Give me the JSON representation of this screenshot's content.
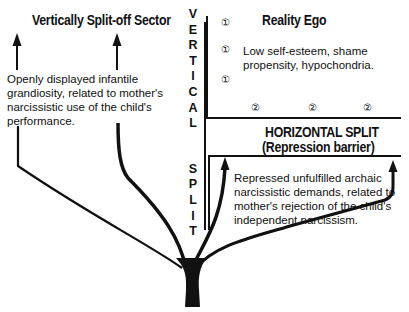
{
  "labels": {
    "vertically_split_off_sector": "Vertically Split-off Sector",
    "reality_ego": "Reality Ego",
    "horizontal_split_line1": "HORIZONTAL SPLIT",
    "horizontal_split_line2": "(Repression barrier)",
    "vertical_split_letters": [
      "V",
      "E",
      "R",
      "T",
      "I",
      "C",
      "A",
      "L",
      "",
      "S",
      "P",
      "L",
      "I",
      "T"
    ]
  },
  "texts": {
    "vertical_sector_description": "Openly displayed infantile grandiosity, related to mother's narcissistic use of the child's performance.",
    "reality_ego_description": "Low self-esteem, shame propensity, hypochondria.",
    "repressed_description": "Repressed unfulfilled archaic narcissistic demands, related to mother's rejection of the child's independent narcissism."
  },
  "markers": {
    "one": "①",
    "two": "②",
    "reality_ego_markers": [
      "①",
      "①",
      "①"
    ],
    "barrier_markers": [
      "②",
      "②",
      "②"
    ]
  },
  "colors": {
    "ink": "#111111",
    "background": "#ffffff"
  }
}
